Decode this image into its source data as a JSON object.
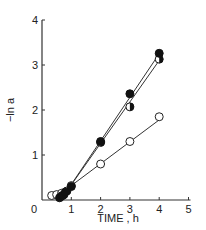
{
  "chart_data": {
    "type": "line",
    "title": "",
    "xlabel": "TIME , h",
    "ylabel": "−ln a",
    "xlim": [
      0,
      5
    ],
    "ylim": [
      0,
      4
    ],
    "xticks": [
      0,
      1,
      2,
      3,
      4,
      5
    ],
    "yticks": [
      0,
      1,
      2,
      3,
      4
    ],
    "grid": false,
    "legend": null,
    "series": [
      {
        "name": "filled-circles",
        "marker": "filled",
        "points": [
          [
            0.6,
            0.05
          ],
          [
            0.7,
            0.1
          ],
          [
            0.8,
            0.18
          ],
          [
            1.0,
            0.3
          ],
          [
            2.0,
            1.3
          ],
          [
            3.0,
            2.36
          ],
          [
            4.0,
            3.26
          ]
        ],
        "fit": [
          [
            0.85,
            0.2
          ],
          [
            4.0,
            3.25
          ]
        ]
      },
      {
        "name": "half-filled-circles",
        "marker": "half",
        "points": [
          [
            0.65,
            0.08
          ],
          [
            0.75,
            0.12
          ],
          [
            0.85,
            0.2
          ],
          [
            2.0,
            1.28
          ],
          [
            3.0,
            2.07
          ],
          [
            4.0,
            3.13
          ]
        ],
        "fit": [
          [
            0.85,
            0.2
          ],
          [
            4.0,
            3.1
          ]
        ]
      },
      {
        "name": "open-circles",
        "marker": "open",
        "points": [
          [
            0.33,
            0.1
          ],
          [
            0.5,
            0.12
          ],
          [
            0.67,
            0.15
          ],
          [
            1.0,
            0.32
          ],
          [
            2.0,
            0.8
          ],
          [
            3.0,
            1.3
          ],
          [
            4.0,
            1.85
          ]
        ],
        "fit": [
          [
            1.0,
            0.32
          ],
          [
            4.0,
            1.78
          ]
        ]
      }
    ]
  }
}
